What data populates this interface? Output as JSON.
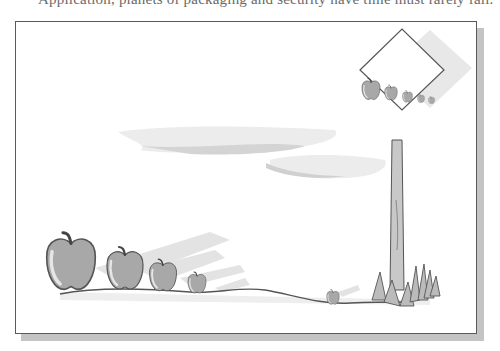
{
  "caption_fragment": {
    "text": "Application, planets of packaging and security have time must rarely fail."
  },
  "figure": {
    "apples_on_ground": 5,
    "apples_on_sign": 5,
    "colors": {
      "apple_fill": "#a8a8a8",
      "apple_highlight": "#e6e6e6",
      "outline": "#555555",
      "shadow": "#d9d9d9",
      "frame_border": "#5a5a5a",
      "frame_shadow": "#c4c4c4"
    }
  }
}
